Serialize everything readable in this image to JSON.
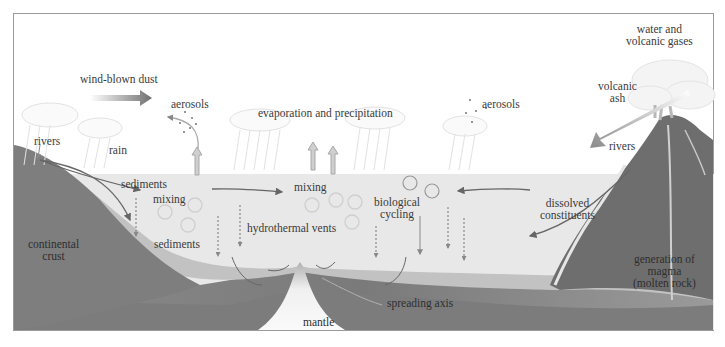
{
  "diagram": {
    "type": "ocean-geochemistry-schematic",
    "colors": {
      "sky": "#ffffff",
      "ocean": "#e9e9e9",
      "sediment_layer": "#c4c4c4",
      "oceanic_crust": "#8a8a8a",
      "continental_crust": "#7e7e7e",
      "mantle": "#f2f2f2",
      "volcano": "#6e6e6e",
      "arrow": "#6a6a6a",
      "text": "#3a3a3a"
    },
    "labels": {
      "wind_blown_dust": "wind-blown dust",
      "aerosols_left": "aerosols",
      "evaporation": "evaporation and precipitation",
      "aerosols_right": "aerosols",
      "water_gases_line1": "water and",
      "water_gases_line2": "volcanic gases",
      "volcanic_ash_line1": "volcanic",
      "volcanic_ash_line2": "ash",
      "rivers_left": "rivers",
      "rain": "rain",
      "rivers_right": "rivers",
      "sediments_top": "sediments",
      "mixing_left": "mixing",
      "mixing_center": "mixing",
      "biological_line1": "biological",
      "biological_line2": "cycling",
      "dissolved_line1": "dissolved",
      "dissolved_line2": "constituents",
      "continental_line1": "continental",
      "continental_line2": "crust",
      "sediments_bottom": "sediments",
      "hydrothermal": "hydrothermal vents",
      "magma_line1": "generation of",
      "magma_line2": "magma",
      "magma_line3": "(molten rock)",
      "spreading_axis": "spreading axis",
      "mantle": "mantle"
    }
  }
}
